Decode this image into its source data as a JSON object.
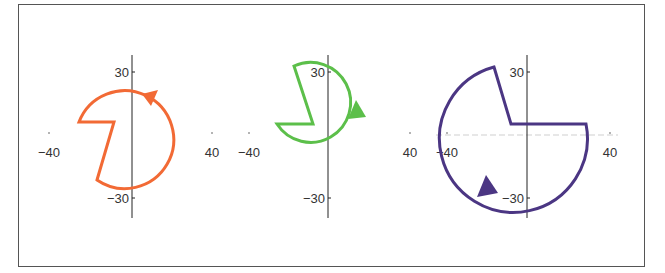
{
  "figure": {
    "panels": [
      {
        "id": "orange",
        "color": "#f26a35",
        "x_ticks": [
          {
            "value": -40,
            "label": "−40"
          },
          {
            "value": 40,
            "label": "40"
          }
        ],
        "y_ticks": [
          {
            "value": 30,
            "label": "30"
          },
          {
            "value": -30,
            "label": "−30"
          }
        ],
        "shape": {
          "radius_approx": 24,
          "wedge": "left-side notch",
          "arrow_direction": "counterclockwise at upper right"
        }
      },
      {
        "id": "green",
        "color": "#5cbf4a",
        "x_ticks": [
          {
            "value": -40,
            "label": "−40"
          },
          {
            "value": 40,
            "label": "40"
          }
        ],
        "y_ticks": [
          {
            "value": 30,
            "label": "30"
          },
          {
            "value": -30,
            "label": "−30"
          }
        ],
        "shape": {
          "radius_approx": 19,
          "wedge": "upper-left notch",
          "arrow_direction": "counterclockwise at right"
        }
      },
      {
        "id": "purple",
        "color": "#4b3683",
        "x_ticks": [
          {
            "value": -40,
            "label": "−40"
          },
          {
            "value": 40,
            "label": "40"
          }
        ],
        "y_ticks": [
          {
            "value": 30,
            "label": "30"
          },
          {
            "value": -30,
            "label": "−30"
          }
        ],
        "shape": {
          "radius_approx": 35,
          "wedge": "upper-right notch",
          "arrow_direction": "counterclockwise at lower left"
        }
      }
    ]
  }
}
